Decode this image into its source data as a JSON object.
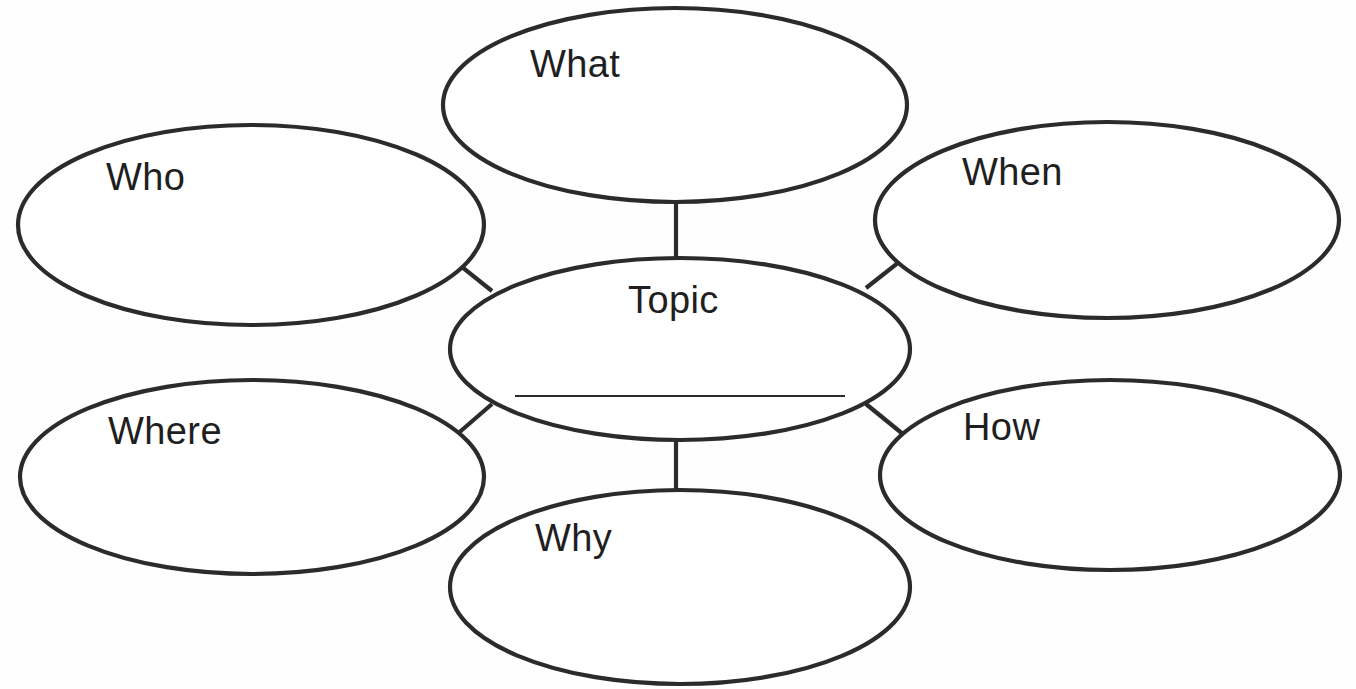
{
  "document": {
    "title": "5W1H Topic Web Graphic Organizer",
    "background_color": "#ffffff",
    "stroke_color": "#2b2b2b",
    "text_color": "#1f1f1f"
  },
  "diagram": {
    "type": "concept-web",
    "center": {
      "id": "topic",
      "label": "Topic",
      "has_write_on_line": true,
      "cx": 680,
      "cy": 349,
      "rx": 230,
      "ry": 91,
      "label_x": 628,
      "label_y": 281,
      "line": {
        "x1": 515,
        "x2": 845,
        "y": 396
      }
    },
    "nodes": [
      {
        "id": "what",
        "label": "What",
        "position": "top",
        "cx": 675,
        "cy": 105,
        "rx": 232,
        "ry": 97,
        "label_x": 530,
        "label_y": 45
      },
      {
        "id": "who",
        "label": "Who",
        "position": "upper-left",
        "cx": 251,
        "cy": 225,
        "rx": 233,
        "ry": 100,
        "label_x": 106,
        "label_y": 158
      },
      {
        "id": "when",
        "label": "When",
        "position": "upper-right",
        "cx": 1107,
        "cy": 220,
        "rx": 232,
        "ry": 98,
        "label_x": 962,
        "label_y": 153
      },
      {
        "id": "where",
        "label": "Where",
        "position": "lower-left",
        "cx": 252,
        "cy": 477,
        "rx": 232,
        "ry": 97,
        "label_x": 108,
        "label_y": 412
      },
      {
        "id": "how",
        "label": "How",
        "position": "lower-right",
        "cx": 1110,
        "cy": 475,
        "rx": 230,
        "ry": 95,
        "label_x": 963,
        "label_y": 408
      },
      {
        "id": "why",
        "label": "Why",
        "position": "bottom",
        "cx": 680,
        "cy": 587,
        "rx": 230,
        "ry": 97,
        "label_x": 535,
        "label_y": 519
      }
    ],
    "connectors": [
      {
        "id": "what-topic",
        "from": "what",
        "to": "topic",
        "x1": 676,
        "y1": 202,
        "x2": 676,
        "y2": 259
      },
      {
        "id": "who-topic",
        "from": "who",
        "to": "topic",
        "x1": 437,
        "y1": 247,
        "x2": 492,
        "y2": 291
      },
      {
        "id": "when-topic",
        "from": "when",
        "to": "topic",
        "x1": 922,
        "y1": 244,
        "x2": 866,
        "y2": 288
      },
      {
        "id": "where-topic",
        "from": "where",
        "to": "topic",
        "x1": 440,
        "y1": 449,
        "x2": 492,
        "y2": 404
      },
      {
        "id": "how-topic",
        "from": "how",
        "to": "topic",
        "x1": 920,
        "y1": 448,
        "x2": 866,
        "y2": 404
      },
      {
        "id": "why-topic",
        "from": "why",
        "to": "topic",
        "x1": 676,
        "y1": 440,
        "x2": 676,
        "y2": 494
      }
    ]
  }
}
